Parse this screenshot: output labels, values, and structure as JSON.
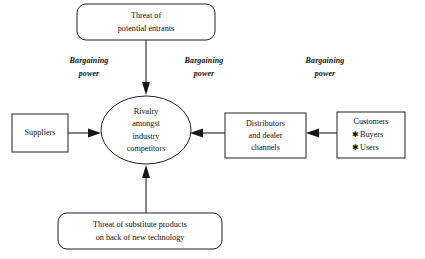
{
  "diagram": {
    "background_color": "#ffffff",
    "line_color": "#222222",
    "text_color": "#111111",
    "nodes": {
      "threat_entrants": {
        "label": "Threat of potential entrants",
        "line1": "Threat of",
        "line2": "potential entrants",
        "shape": "rounded-rectangle"
      },
      "rivalry": {
        "label": "Rivalry amongst industry competitors",
        "line1": "Rivalry",
        "line2": "amongst",
        "line3": "industry",
        "line4": "competitors",
        "shape": "ellipse"
      },
      "suppliers": {
        "label": "Suppliers",
        "line1": "Suppliers",
        "shape": "rectangle"
      },
      "distributors": {
        "label": "Distributors and dealer channels",
        "line1": "Distributors",
        "line2": "and dealer",
        "line3": "channels",
        "shape": "rectangle"
      },
      "customers": {
        "label": "Customers",
        "line1": "Customers",
        "bullet_glyph": "✱",
        "bullet1": "Buyers",
        "bullet2": "Users",
        "shape": "rectangle"
      },
      "threat_substitutes": {
        "label": "Threat of substitute products on back of new technology",
        "line1": "Threat of substitute products",
        "line2": "on back of new technology",
        "shape": "rounded-rectangle"
      }
    },
    "force_labels": {
      "left": {
        "line1": "Bargaining",
        "line2": "power"
      },
      "middle": {
        "line1": "Bargaining",
        "line2": "power"
      },
      "right": {
        "line1": "Bargaining",
        "line2": "power"
      }
    },
    "connectors": {
      "entrants_to_rivalry": "Threat of potential entrants → Rivalry",
      "suppliers_to_rivalry": "Suppliers → Rivalry",
      "distributors_to_rivalry": "Distributors and dealer channels → Rivalry",
      "customers_to_distributors": "Customers → Distributors and dealer channels",
      "substitutes_to_rivalry": "Threat of substitute products → Rivalry"
    }
  }
}
